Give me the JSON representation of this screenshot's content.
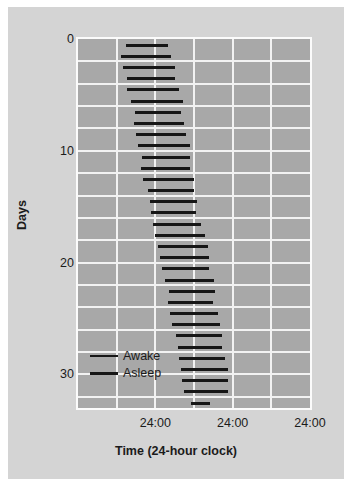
{
  "chart_data": {
    "type": "bar",
    "title": "",
    "subtitle": "",
    "xlabel": "Time (24-hour clock)",
    "ylabel": "Days",
    "grid": true,
    "legend_position": "inside-lower-left",
    "xlim": [
      0,
      72
    ],
    "ylim": [
      0,
      33
    ],
    "xtick_labels": [
      "24:00",
      "24:00",
      "24:00"
    ],
    "xtick_values": [
      24,
      48,
      72
    ],
    "ytick_labels": [
      "0",
      "10",
      "20",
      "30"
    ],
    "ytick_values": [
      0,
      10,
      20,
      30
    ],
    "x_unit": "hours (double-plotted, 3 days across)",
    "legend": [
      {
        "name": "Awake",
        "style": "thin-line",
        "color": "#161616"
      },
      {
        "name": "Asleep",
        "style": "thick-line",
        "color": "#161616"
      }
    ],
    "note": "Actogram of a free-running sleep-wake rhythm; sleep onset drifts later each day.",
    "series": [
      {
        "name": "Asleep",
        "day": 0,
        "start": 14.8,
        "end": 28.0
      },
      {
        "name": "Asleep",
        "day": 1,
        "start": 13.4,
        "end": 28.9
      },
      {
        "name": "Asleep",
        "day": 2,
        "start": 14.0,
        "end": 30.2
      },
      {
        "name": "Asleep",
        "day": 3,
        "start": 15.1,
        "end": 30.2
      },
      {
        "name": "Asleep",
        "day": 4,
        "start": 15.1,
        "end": 31.5
      },
      {
        "name": "Asleep",
        "day": 5,
        "start": 16.6,
        "end": 32.6
      },
      {
        "name": "Asleep",
        "day": 6,
        "start": 17.6,
        "end": 32.0
      },
      {
        "name": "Asleep",
        "day": 7,
        "start": 17.3,
        "end": 32.8
      },
      {
        "name": "Asleep",
        "day": 8,
        "start": 17.9,
        "end": 33.6
      },
      {
        "name": "Asleep",
        "day": 9,
        "start": 18.7,
        "end": 34.7
      },
      {
        "name": "Asleep",
        "day": 10,
        "start": 19.9,
        "end": 34.7
      },
      {
        "name": "Asleep",
        "day": 11,
        "start": 19.6,
        "end": 34.7
      },
      {
        "name": "Asleep",
        "day": 12,
        "start": 20.2,
        "end": 36.0
      },
      {
        "name": "Asleep",
        "day": 13,
        "start": 21.6,
        "end": 36.0
      },
      {
        "name": "Asleep",
        "day": 14,
        "start": 22.2,
        "end": 37.0
      },
      {
        "name": "Asleep",
        "day": 15,
        "start": 22.8,
        "end": 36.6
      },
      {
        "name": "Asleep",
        "day": 16,
        "start": 23.4,
        "end": 38.2
      },
      {
        "name": "Asleep",
        "day": 17,
        "start": 23.8,
        "end": 39.3
      },
      {
        "name": "Asleep",
        "day": 18,
        "start": 24.8,
        "end": 40.4
      },
      {
        "name": "Asleep",
        "day": 19,
        "start": 25.6,
        "end": 40.8
      },
      {
        "name": "Asleep",
        "day": 20,
        "start": 26.2,
        "end": 40.8
      },
      {
        "name": "Asleep",
        "day": 21,
        "start": 26.9,
        "end": 42.2
      },
      {
        "name": "Asleep",
        "day": 22,
        "start": 28.2,
        "end": 42.6
      },
      {
        "name": "Asleep",
        "day": 23,
        "start": 27.9,
        "end": 42.0
      },
      {
        "name": "Asleep",
        "day": 24,
        "start": 28.5,
        "end": 43.3
      },
      {
        "name": "Asleep",
        "day": 25,
        "start": 29.2,
        "end": 44.2
      },
      {
        "name": "Asleep",
        "day": 26,
        "start": 30.4,
        "end": 44.8
      },
      {
        "name": "Asleep",
        "day": 27,
        "start": 31.0,
        "end": 44.8
      },
      {
        "name": "Asleep",
        "day": 28,
        "start": 31.2,
        "end": 45.6
      },
      {
        "name": "Asleep",
        "day": 29,
        "start": 32.0,
        "end": 46.4
      },
      {
        "name": "Asleep",
        "day": 30,
        "start": 32.4,
        "end": 46.4
      },
      {
        "name": "Asleep",
        "day": 31,
        "start": 33.0,
        "end": 46.4
      },
      {
        "name": "Asleep",
        "day": 32,
        "start": 35.2,
        "end": 41.0
      }
    ]
  },
  "axes": {
    "y_title": "Days",
    "x_title": "Time (24-hour clock)",
    "y_ticks": [
      {
        "label": "0",
        "value": 0
      },
      {
        "label": "10",
        "value": 10
      },
      {
        "label": "20",
        "value": 20
      },
      {
        "label": "30",
        "value": 30
      }
    ],
    "x_ticks": [
      {
        "label": "24:00",
        "value": 24
      },
      {
        "label": "24:00",
        "value": 48
      },
      {
        "label": "24:00",
        "value": 72
      }
    ]
  },
  "legend": {
    "items": [
      {
        "label": "Awake",
        "weight": "thin"
      },
      {
        "label": "Asleep",
        "weight": "thick"
      }
    ]
  },
  "colors": {
    "page_background": "#ffffff",
    "figure_panel": "#d4d4d4",
    "plot_background": "#a8a8a8",
    "gridline": "#f2f2f2",
    "bar": "#161616",
    "text": "#1b1b1b"
  }
}
